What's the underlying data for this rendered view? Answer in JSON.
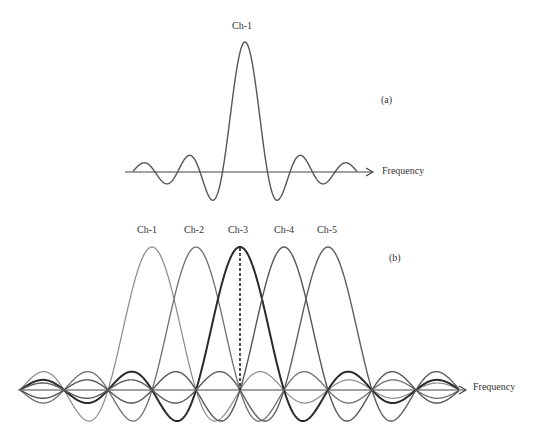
{
  "panel_a": {
    "label": "(a)",
    "channel_label": "Ch-1",
    "axis_label": "Frequency"
  },
  "panel_b": {
    "label": "(b)",
    "channels": [
      "Ch-1",
      "Ch-2",
      "Ch-3",
      "Ch-4",
      "Ch-5"
    ],
    "axis_label": "Frequency",
    "highlighted_channel": "Ch-3"
  },
  "colors": {
    "ch1": "#8a8a8a",
    "ch2": "#6e6e6e",
    "ch3": "#2a2a2a",
    "ch4": "#555555",
    "ch5": "#5e5e5e",
    "axis": "#444444"
  },
  "chart_data": [
    {
      "type": "line",
      "title": "(a) Single channel sinc spectrum",
      "xlabel": "Frequency",
      "ylabel": "",
      "series": [
        {
          "name": "Ch-1",
          "function": "sinc",
          "center": 0,
          "zeros_each_side": 5
        }
      ],
      "annotations": [
        "Ch-1"
      ]
    },
    {
      "type": "line",
      "title": "(b) Overlapping orthogonal sinc subcarriers",
      "xlabel": "Frequency",
      "ylabel": "",
      "series": [
        {
          "name": "Ch-1",
          "center": -2
        },
        {
          "name": "Ch-2",
          "center": -1
        },
        {
          "name": "Ch-3",
          "center": 0
        },
        {
          "name": "Ch-4",
          "center": 1
        },
        {
          "name": "Ch-5",
          "center": 2
        }
      ],
      "annotations": [
        "dashed vertical line at Ch-3 peak"
      ]
    }
  ]
}
